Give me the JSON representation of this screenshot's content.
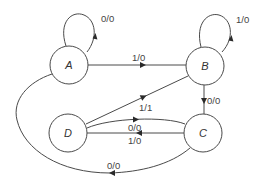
{
  "diagram": {
    "type": "finite-state-machine",
    "states": [
      {
        "id": "A",
        "label": "A",
        "cx": 69,
        "cy": 65
      },
      {
        "id": "B",
        "label": "B",
        "cx": 205,
        "cy": 66
      },
      {
        "id": "C",
        "label": "C",
        "cx": 203,
        "cy": 133
      },
      {
        "id": "D",
        "label": "D",
        "cx": 68,
        "cy": 133
      }
    ],
    "transitions": [
      {
        "from": "A",
        "to": "A",
        "label": "0/0"
      },
      {
        "from": "B",
        "to": "B",
        "label": "1/0"
      },
      {
        "from": "A",
        "to": "B",
        "label": "1/0"
      },
      {
        "from": "B",
        "to": "C",
        "label": "0/0"
      },
      {
        "from": "D",
        "to": "B",
        "label": "1/1"
      },
      {
        "from": "D",
        "to": "C",
        "label": "0/0"
      },
      {
        "from": "C",
        "to": "D",
        "label": "1/0"
      },
      {
        "from": "C",
        "to": "A",
        "label": "0/0"
      }
    ],
    "colors": {
      "stroke": "#4a4a4a",
      "text": "#333333",
      "background": "#ffffff"
    }
  }
}
